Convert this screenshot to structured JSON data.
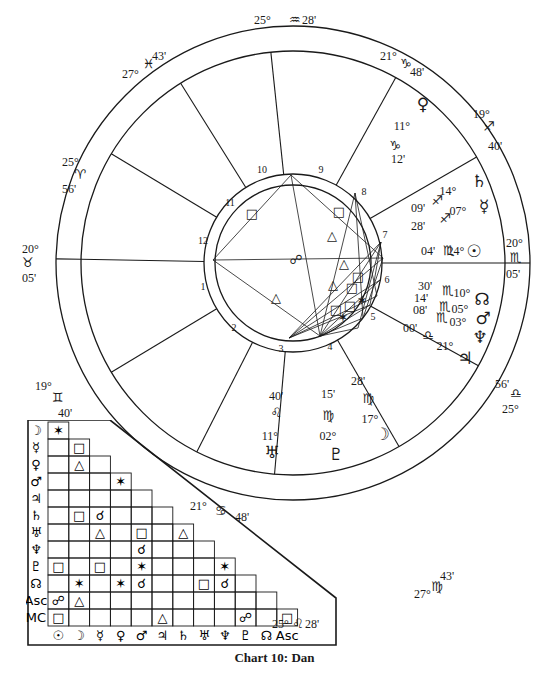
{
  "caption": "Chart 10: Dan",
  "wheel": {
    "house_cusps": [
      {
        "house": 1,
        "deg": "20°",
        "sign": "♉",
        "min": "05'"
      },
      {
        "house": 2,
        "deg": "19°",
        "sign": "♊",
        "min": "40'"
      },
      {
        "house": 3,
        "deg": "21°",
        "sign": "♋",
        "min": "48'"
      },
      {
        "house": 4,
        "deg": "25°",
        "sign": "♌",
        "min": "28'"
      },
      {
        "house": 5,
        "deg": "27°",
        "sign": "♍",
        "min": "43'"
      },
      {
        "house": 6,
        "deg": "25°",
        "sign": "♎",
        "min": "56'"
      },
      {
        "house": 7,
        "deg": "20°",
        "sign": "♏",
        "min": "05'"
      },
      {
        "house": 8,
        "deg": "19°",
        "sign": "♐",
        "min": "40'"
      },
      {
        "house": 9,
        "deg": "21°",
        "sign": "♑",
        "min": "48'"
      },
      {
        "house": 10,
        "deg": "25°",
        "sign": "♒",
        "min": "28'"
      },
      {
        "house": 11,
        "deg": "27°",
        "sign": "♓",
        "min": "43'"
      },
      {
        "house": 12,
        "deg": "25°",
        "sign": "♈",
        "min": "56'"
      }
    ],
    "planets": [
      {
        "name": "Venus",
        "glyph": "♀",
        "deg": "11°",
        "sign": "♑",
        "min": "12'"
      },
      {
        "name": "Saturn",
        "glyph": "♄",
        "deg": "14°",
        "sign": "♐",
        "min": "09'"
      },
      {
        "name": "Mercury",
        "glyph": "☿",
        "deg": "07°",
        "sign": "♐",
        "min": "28'"
      },
      {
        "name": "Sun",
        "glyph": "☉",
        "deg": "24°",
        "sign": "♏",
        "min": "04'"
      },
      {
        "name": "North Node",
        "glyph": "☊",
        "deg": "10°",
        "sign": "♏",
        "min": "30'"
      },
      {
        "name": "Mars",
        "glyph": "♂",
        "deg": "05°",
        "sign": "♏",
        "min": "14'"
      },
      {
        "name": "Neptune",
        "glyph": "♆",
        "deg": "03°",
        "sign": "♏",
        "min": "08'"
      },
      {
        "name": "Jupiter",
        "glyph": "♃",
        "deg": "21°",
        "sign": "♎",
        "min": "00'"
      },
      {
        "name": "Moon",
        "glyph": "☽",
        "deg": "17°",
        "sign": "♍",
        "min": "28'"
      },
      {
        "name": "Pluto",
        "glyph": "♇",
        "deg": "02°",
        "sign": "♍",
        "min": "15'"
      },
      {
        "name": "Uranus",
        "glyph": "♅",
        "deg": "11°",
        "sign": "♌",
        "min": "40'"
      }
    ],
    "house_numbers": [
      "1",
      "2",
      "3",
      "4",
      "5",
      "6",
      "7",
      "8",
      "9",
      "10",
      "11",
      "12"
    ],
    "center_glyph": "☍"
  },
  "aspect_grid": {
    "row_labels": [
      "☽",
      "☿",
      "♀",
      "♂",
      "♃",
      "♄",
      "♅",
      "♆",
      "♇",
      "☊",
      "Asc",
      "MC"
    ],
    "col_labels": [
      "☉",
      "☽",
      "☿",
      "♀",
      "♂",
      "♃",
      "♄",
      "♅",
      "♆",
      "♇",
      "☊",
      "Asc"
    ],
    "cells": [
      [
        "✶"
      ],
      [
        "",
        "□"
      ],
      [
        "",
        "△",
        ""
      ],
      [
        "",
        "",
        "",
        "✶"
      ],
      [
        "",
        "",
        "",
        "",
        ""
      ],
      [
        "",
        "□",
        "☌",
        "",
        "",
        ""
      ],
      [
        "",
        "",
        "△",
        "",
        "□",
        "",
        "△"
      ],
      [
        "",
        "",
        "",
        "",
        "☌",
        "",
        "",
        ""
      ],
      [
        "□",
        "",
        "□",
        "",
        "✶",
        "",
        "",
        "",
        "✶"
      ],
      [
        "",
        "✶",
        "",
        "✶",
        "☌",
        "",
        "",
        "□",
        "☌",
        ""
      ],
      [
        "☍",
        "△",
        "",
        "",
        "",
        "",
        "",
        "",
        "",
        "",
        ""
      ],
      [
        "□",
        "",
        "",
        "",
        "",
        "△",
        "",
        "",
        "",
        "☍",
        "",
        "□"
      ]
    ]
  }
}
